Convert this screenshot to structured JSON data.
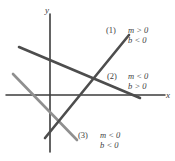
{
  "figure": {
    "axes": {
      "x_label": "x",
      "y_label": "y",
      "origin": {
        "x": 50,
        "y": 95
      },
      "x_axis_from": {
        "x": 6,
        "y": 95
      },
      "x_axis_to": {
        "x": 165,
        "y": 95
      },
      "y_axis_from": {
        "x": 50,
        "y": 14
      },
      "y_axis_to": {
        "x": 50,
        "y": 152
      },
      "axis_color": "#3d3d3d"
    },
    "lines": [
      {
        "tag": "(1)",
        "slope_condition": "m > 0",
        "intercept_condition": "b < 0",
        "color": "#4d4d4d",
        "from": {
          "x": 45,
          "y": 138
        },
        "to": {
          "x": 129,
          "y": 35
        }
      },
      {
        "tag": "(2)",
        "slope_condition": "m < 0",
        "intercept_condition": "b > 0",
        "color": "#4d4d4d",
        "from": {
          "x": 19,
          "y": 47
        },
        "to": {
          "x": 140,
          "y": 98
        }
      },
      {
        "tag": "(3)",
        "slope_condition": "m < 0",
        "intercept_condition": "b < 0",
        "color": "#8f8f8f",
        "from": {
          "x": 13,
          "y": 74
        },
        "to": {
          "x": 77,
          "y": 140
        }
      }
    ]
  }
}
